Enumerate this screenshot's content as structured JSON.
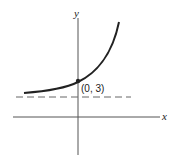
{
  "diagram": {
    "axes": {
      "x_label": "x",
      "y_label": "y"
    },
    "point": {
      "label": "(0, 3)"
    },
    "asymptote": {
      "style": "dashed"
    },
    "colors": {
      "stroke": "#222222",
      "asymptote": "#555555",
      "background": "#ffffff"
    }
  }
}
